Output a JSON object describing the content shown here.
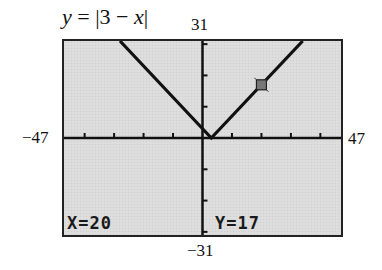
{
  "chart_data": {
    "type": "line",
    "title": "y = |3 − x|",
    "function": "abs(3 - x)",
    "window": {
      "xmin": -47,
      "xmax": 47,
      "ymin": -31,
      "ymax": 31,
      "xscl": 10,
      "yscl": 10
    },
    "series": [
      {
        "name": "y = |3 − x|",
        "x": [
          -47,
          -28,
          3,
          20,
          34
        ],
        "values": [
          50,
          31,
          0,
          17,
          31
        ]
      }
    ],
    "vertex": {
      "x": 3,
      "y": 0
    },
    "trace_point": {
      "x": 20,
      "y": 17
    },
    "xlabel": "",
    "ylabel": "",
    "xlim": [
      -47,
      47
    ],
    "ylim": [
      -31,
      31
    ],
    "grid": false,
    "legend": "none"
  },
  "title": {
    "lhs": "y",
    "eq": " = |3 − ",
    "var": "x",
    "close": "|"
  },
  "axis_labels": {
    "ymax": "31",
    "ymin": "−31",
    "xmin": "−47",
    "xmax": "47"
  },
  "readout": {
    "x_text": "X=20",
    "y_text": "Y=17"
  },
  "colors": {
    "screen_bg": "#dcdcdc",
    "line": "#111111",
    "cursor_fill": "#777777",
    "border": "#222222"
  }
}
